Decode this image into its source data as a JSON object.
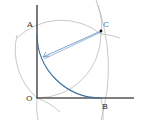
{
  "diagram": {
    "type": "geometric-construction",
    "labels": {
      "O": "O",
      "A": "A",
      "B": "B",
      "C": "C"
    },
    "points": {
      "O": [
        37,
        98
      ],
      "A": [
        37,
        34
      ],
      "B": [
        101,
        98
      ],
      "C": [
        101,
        34
      ]
    },
    "radius": 64,
    "colors": {
      "axis": "#333333",
      "construction_arc": "#a8a8a8",
      "quarter_arc": "#3d6e9c",
      "arrow_line": "#5b8cc0",
      "point": "#111111"
    }
  }
}
